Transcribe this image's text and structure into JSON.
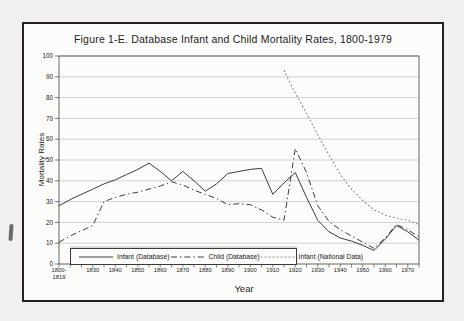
{
  "figure": {
    "title": "Figure 1-E.  Database Infant and Child Mortality Rates, 1800-1979"
  },
  "chart_data": {
    "type": "line",
    "title": "Figure 1-E.  Database Infant and Child Mortality Rates, 1800-1979",
    "xlabel": "Year",
    "ylabel": "Mortality Rates",
    "ylim": [
      0,
      100
    ],
    "y_ticks": [
      0,
      10,
      20,
      30,
      40,
      50,
      60,
      70,
      80,
      90,
      100
    ],
    "grid": true,
    "legend_position": "bottom-left",
    "x_tick_labels": [
      "1800-1819",
      "1830",
      "1840",
      "1850",
      "1860",
      "1870",
      "1880",
      "1890",
      "1900",
      "1910",
      "1920",
      "1930",
      "1940",
      "1950",
      "1960",
      "1970"
    ],
    "categories": [
      "1800-1819",
      "1820",
      "1825",
      "1830",
      "1835",
      "1840",
      "1845",
      "1850",
      "1855",
      "1860",
      "1865",
      "1870",
      "1875",
      "1880",
      "1885",
      "1890",
      "1895",
      "1900",
      "1905",
      "1910",
      "1915",
      "1920",
      "1925",
      "1930",
      "1935",
      "1940",
      "1945",
      "1950",
      "1955",
      "1960",
      "1965",
      "1970",
      "1975"
    ],
    "series": [
      {
        "name": "Infant (Database)",
        "style": "solid",
        "color": "#3c3c3c",
        "values": [
          28,
          31,
          33.5,
          36,
          38.5,
          40.5,
          43,
          45.5,
          48.5,
          44.5,
          40,
          44.5,
          40,
          35,
          38.5,
          43.5,
          44.5,
          45.5,
          46,
          33.5,
          39,
          44,
          32,
          21,
          15.5,
          12.5,
          11,
          9,
          6.5,
          12,
          18.5,
          15.5,
          11.5
        ]
      },
      {
        "name": "Child (Database)",
        "style": "dashdot",
        "color": "#3c3c3c",
        "values": [
          10.5,
          13.5,
          16,
          18.5,
          30,
          32,
          33.5,
          34.5,
          36,
          37.5,
          39.5,
          38,
          35.5,
          33.5,
          31.5,
          28.5,
          29,
          28.5,
          26,
          22.5,
          21,
          55.5,
          44,
          28,
          20.5,
          16.5,
          13.5,
          10.5,
          7.5,
          12.5,
          19,
          16.5,
          13
        ]
      },
      {
        "name": "Infant (National Data)",
        "style": "dotted",
        "color": "#8c8c8c",
        "values": [
          null,
          null,
          null,
          null,
          null,
          null,
          null,
          null,
          null,
          null,
          null,
          null,
          null,
          null,
          null,
          null,
          null,
          null,
          null,
          null,
          93,
          82,
          72.5,
          62,
          52.5,
          43,
          36,
          30.5,
          26,
          23.5,
          22,
          21,
          19
        ]
      }
    ]
  }
}
